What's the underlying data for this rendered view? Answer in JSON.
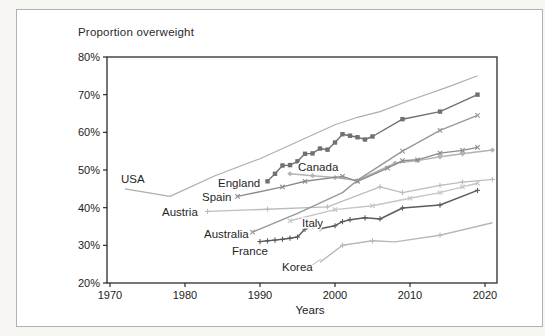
{
  "chart_data": {
    "type": "line",
    "title": "Proportion overweight",
    "xlabel": "Years",
    "xlim": [
      1970,
      2023
    ],
    "ylim": [
      20,
      80
    ],
    "grid": false,
    "legend_position": "inline-labels",
    "x_ticks": [
      1970,
      1980,
      1990,
      2000,
      2010,
      2020
    ],
    "x_tick_labels": [
      "1970",
      "1980",
      "1990",
      "2000",
      "2010",
      "2020"
    ],
    "y_ticks": [
      20,
      30,
      40,
      50,
      60,
      70,
      80
    ],
    "y_tick_labels": [
      "20%",
      "30%",
      "40%",
      "50%",
      "60%",
      "70%",
      "80%"
    ],
    "axis_color": "#2b2b2b",
    "series": [
      {
        "name": "USA",
        "color": "#aeaeae",
        "marker": "none",
        "label_px": [
          121,
          183
        ],
        "points": [
          [
            1972,
            45
          ],
          [
            1978,
            43
          ],
          [
            1984,
            48.5
          ],
          [
            1990,
            53
          ],
          [
            1995,
            57.5
          ],
          [
            2000,
            62
          ],
          [
            2003,
            64
          ],
          [
            2006,
            65.5
          ],
          [
            2010,
            68.5
          ],
          [
            2015,
            72
          ],
          [
            2019,
            75
          ]
        ]
      },
      {
        "name": "Austria",
        "color": "#bdbdbd",
        "marker": "plus",
        "label_px": [
          162,
          216
        ],
        "points": [
          [
            1983,
            39
          ],
          [
            1991,
            39.6
          ],
          [
            1999,
            40.2
          ],
          [
            2006,
            45.5
          ],
          [
            2009,
            44
          ],
          [
            2014,
            45.9
          ],
          [
            2017,
            46.8
          ],
          [
            2021,
            47.5
          ]
        ]
      },
      {
        "name": "Italy",
        "color": "#c6c6c6",
        "marker": "x",
        "label_px": [
          302,
          227
        ],
        "points": [
          [
            1994,
            36.5
          ],
          [
            2000,
            39.5
          ],
          [
            2005,
            40.5
          ],
          [
            2010,
            42.5
          ],
          [
            2014,
            44
          ],
          [
            2017,
            45.5
          ],
          [
            2019,
            46.5
          ]
        ]
      },
      {
        "name": "Korea",
        "color": "#b8b8b8",
        "marker": "plus",
        "marker_years": [
          2001,
          2005,
          2014
        ],
        "label_px": [
          282,
          271
        ],
        "leader_px": [
          311,
          266,
          321,
          259
        ],
        "points": [
          [
            1998,
            25.5
          ],
          [
            2001,
            30
          ],
          [
            2005,
            31.2
          ],
          [
            2008,
            30.9
          ],
          [
            2014,
            32.7
          ],
          [
            2021,
            36
          ]
        ]
      },
      {
        "name": "Canada",
        "color": "#b3b3b3",
        "marker": "diamond",
        "label_px": [
          298,
          171
        ],
        "points": [
          [
            1994,
            49
          ],
          [
            1997,
            48.5
          ],
          [
            2000,
            48
          ],
          [
            2003,
            47.2
          ],
          [
            2008,
            51.8
          ],
          [
            2011,
            52.5
          ],
          [
            2014,
            53.5
          ],
          [
            2017,
            54.3
          ],
          [
            2021,
            55.3
          ]
        ]
      },
      {
        "name": "Spain",
        "color": "#8c8c8c",
        "marker": "x",
        "label_px": [
          202,
          201
        ],
        "points": [
          [
            1987,
            43
          ],
          [
            1993,
            45.5
          ],
          [
            1996,
            47
          ],
          [
            2001,
            48.3
          ],
          [
            2003,
            47
          ],
          [
            2007,
            50.5
          ],
          [
            2009,
            52.5
          ],
          [
            2011,
            52.7
          ],
          [
            2014,
            54.5
          ],
          [
            2017,
            55.2
          ],
          [
            2019,
            56
          ]
        ]
      },
      {
        "name": "Australia",
        "color": "#979797",
        "marker": "x",
        "marker_years": [
          1989,
          2009,
          2014,
          2019
        ],
        "label_px": [
          204,
          238
        ],
        "points": [
          [
            1989,
            33.5
          ],
          [
            1995,
            38.5
          ],
          [
            2001,
            44
          ],
          [
            2003,
            47.3
          ],
          [
            2009,
            55
          ],
          [
            2014,
            60.5
          ],
          [
            2019,
            64.5
          ]
        ]
      },
      {
        "name": "France",
        "color": "#5a5a5a",
        "marker": "plus",
        "label_px": [
          232,
          255
        ],
        "points": [
          [
            1990,
            31
          ],
          [
            1991,
            31.2
          ],
          [
            1992,
            31.4
          ],
          [
            1993,
            31.6
          ],
          [
            1994,
            31.9
          ],
          [
            1995,
            32.2
          ],
          [
            1996,
            34.3
          ],
          [
            1997,
            35.2
          ],
          [
            1998,
            34.4
          ],
          [
            2000,
            35.2
          ],
          [
            2001,
            36.3
          ],
          [
            2002,
            36.8
          ],
          [
            2004,
            37.3
          ],
          [
            2006,
            37
          ],
          [
            2009,
            39.9
          ],
          [
            2014,
            40.7
          ],
          [
            2019,
            44.6
          ]
        ]
      },
      {
        "name": "England",
        "color": "#707070",
        "marker": "square",
        "label_px": [
          218,
          187
        ],
        "points": [
          [
            1991,
            47
          ],
          [
            1992,
            49
          ],
          [
            1993,
            51.2
          ],
          [
            1994,
            51.3
          ],
          [
            1995,
            52.3
          ],
          [
            1996,
            54.3
          ],
          [
            1997,
            54.4
          ],
          [
            1998,
            55.7
          ],
          [
            1999,
            55.4
          ],
          [
            2000,
            57.3
          ],
          [
            2001,
            59.5
          ],
          [
            2002,
            59.1
          ],
          [
            2003,
            58.7
          ],
          [
            2004,
            58.1
          ],
          [
            2005,
            58.9
          ],
          [
            2009,
            63.5
          ],
          [
            2014,
            65.5
          ],
          [
            2019,
            70
          ]
        ]
      }
    ]
  }
}
